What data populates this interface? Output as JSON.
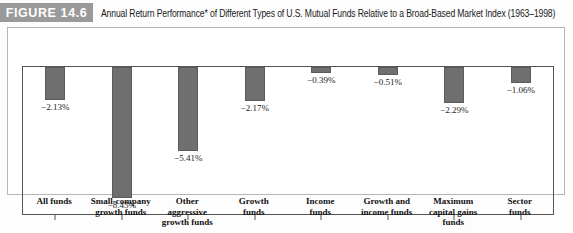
{
  "figure": {
    "badge_label": "FIGURE 14.6",
    "caption": "Annual Return Performance* of Different Types of U.S. Mutual Funds Relative to a Broad-Based Market Index (1963–1998)"
  },
  "colors": {
    "badge_background": "#9a9a9a",
    "bar_fill": "#6f6f6f",
    "axis": "#555555",
    "frame_border": "#b5b5b5"
  },
  "chart_data": {
    "type": "bar",
    "title": "Annual Return Performance* of Different Types of U.S. Mutual Funds Relative to a Broad-Based Market Index (1963–1998)",
    "xlabel": "",
    "ylabel": "",
    "ylim": [
      -9.0,
      0.0
    ],
    "grid": false,
    "legend": "none",
    "orientation": "vertical",
    "categories": [
      "All funds",
      "Small-company growth funds",
      "Other aggressive growth funds",
      "Growth funds",
      "Income funds",
      "Growth and income funds",
      "Maximum capital gains funds",
      "Sector funds"
    ],
    "category_lines": [
      [
        "All funds"
      ],
      [
        "Small-company",
        "growth funds"
      ],
      [
        "Other",
        "aggressive",
        "growth funds"
      ],
      [
        "Growth",
        "funds"
      ],
      [
        "Income",
        "funds"
      ],
      [
        "Growth and",
        "income funds"
      ],
      [
        "Maximum",
        "capital gains",
        "funds"
      ],
      [
        "Sector",
        "funds"
      ]
    ],
    "values": [
      -2.13,
      -8.45,
      -5.41,
      -2.17,
      -0.39,
      -0.51,
      -2.29,
      -1.06
    ],
    "value_labels": [
      "−2.13%",
      "−8.45%",
      "−5.41%",
      "−2.17%",
      "−0.39%",
      "−0.51%",
      "−2.29%",
      "−1.06%"
    ]
  }
}
